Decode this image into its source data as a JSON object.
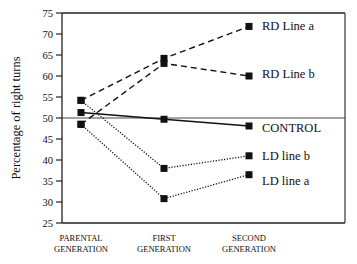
{
  "chart_data": {
    "type": "line",
    "title": "",
    "xlabel": "",
    "ylabel": "Percentage of right turns",
    "ylim": [
      25,
      75
    ],
    "yticks": [
      25,
      30,
      35,
      40,
      45,
      50,
      55,
      60,
      65,
      70,
      75
    ],
    "categories": [
      [
        "PARENTAL",
        "GENERATION"
      ],
      [
        "FIRST",
        "GENERATION"
      ],
      [
        "SECOND",
        "GENERATION"
      ]
    ],
    "reference_line": 50,
    "grid": false,
    "legend": "inline-right",
    "series": [
      {
        "name": "RD Line a",
        "style": "dashed",
        "values": [
          54.2,
          64.2,
          71.8
        ]
      },
      {
        "name": "RD Line b",
        "style": "dashed",
        "values": [
          48.5,
          63.0,
          60.0
        ]
      },
      {
        "name": "CONTROL",
        "style": "solid",
        "values": [
          51.3,
          49.7,
          48.1
        ]
      },
      {
        "name": "LD line b",
        "style": "dotted",
        "values": [
          54.2,
          38.0,
          41.0
        ]
      },
      {
        "name": "LD line a",
        "style": "dotted",
        "values": [
          48.5,
          30.8,
          36.5
        ]
      }
    ]
  }
}
